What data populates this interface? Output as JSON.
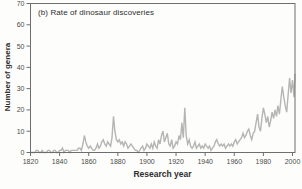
{
  "chart_data": {
    "type": "line",
    "title": "(b) Rate of dinosaur discoveries",
    "xlabel": "Research year",
    "ylabel": "Number of genera",
    "x_start": 1820,
    "x_step": 1,
    "values": [
      0,
      0,
      0,
      0,
      1,
      1,
      0,
      0,
      1,
      0,
      0,
      0,
      1,
      1,
      0,
      0,
      1,
      1,
      0,
      0,
      1,
      1,
      2,
      0,
      1,
      1,
      1,
      0,
      1,
      1,
      1,
      1,
      1,
      2,
      2,
      1,
      4,
      8,
      5,
      3,
      2,
      3,
      2,
      1,
      1,
      2,
      4,
      2,
      3,
      5,
      6,
      4,
      3,
      5,
      4,
      3,
      7,
      17,
      10,
      6,
      5,
      6,
      4,
      5,
      3,
      5,
      4,
      2,
      3,
      4,
      3,
      2,
      1,
      1,
      0,
      1,
      2,
      3,
      1,
      2,
      4,
      3,
      2,
      4,
      2,
      5,
      3,
      2,
      6,
      4,
      8,
      10,
      5,
      7,
      9,
      4,
      3,
      6,
      2,
      3,
      5,
      4,
      8,
      6,
      14,
      7,
      21,
      8,
      4,
      6,
      3,
      2,
      3,
      5,
      2,
      3,
      4,
      2,
      3,
      2,
      4,
      3,
      2,
      3,
      1,
      2,
      3,
      5,
      6,
      4,
      3,
      4,
      3,
      4,
      2,
      3,
      4,
      3,
      4,
      3,
      5,
      6,
      4,
      5,
      6,
      7,
      9,
      7,
      8,
      10,
      11,
      8,
      6,
      9,
      10,
      14,
      18,
      12,
      10,
      16,
      21,
      18,
      14,
      17,
      12,
      15,
      19,
      16,
      20,
      17,
      22,
      18,
      25,
      31,
      26,
      22,
      19,
      27,
      35,
      28,
      34,
      26,
      37
    ],
    "xticks": [
      1820,
      1840,
      1860,
      1880,
      1900,
      1920,
      1940,
      1960,
      1980,
      2000
    ],
    "yticks": [
      0,
      10,
      20,
      30,
      40,
      50,
      60,
      70
    ],
    "xlim": [
      1820,
      2002
    ],
    "ylim": [
      0,
      70
    ],
    "grid": false,
    "legend_position": "none",
    "line_color": "#b5b5b5",
    "frame_color": "#6e6e6e",
    "tick_label_color": "#4c4c4c"
  }
}
